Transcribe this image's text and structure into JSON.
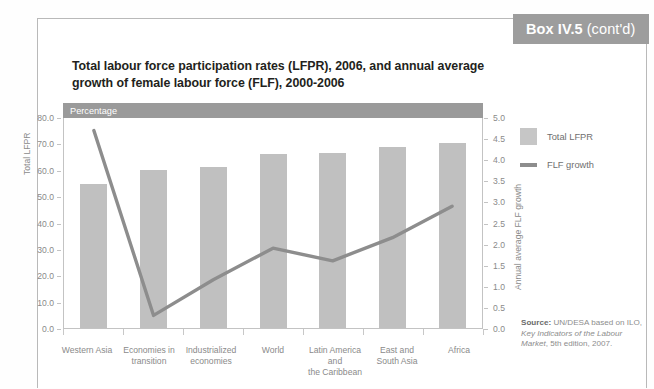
{
  "box_header": {
    "label_bold": "Box IV.5",
    "label_cont": "(cont'd)"
  },
  "chart_title": "Total labour force participation rates (LFPR), 2006, and annual average growth of female labour force (FLF), 2000-2006",
  "percentage_band": "Percentage",
  "legend": [
    {
      "label": "Total LFPR",
      "type": "bar",
      "color": "#c6c6c6"
    },
    {
      "label": "FLF growth",
      "type": "line",
      "color": "#8d8d8d"
    }
  ],
  "source": {
    "prefix": "Source:",
    "text_1": " UN/DESA based on ILO, ",
    "italic_1": "Key Indicators of the Labour Market",
    "text_2": ", 5th edition, 2007."
  },
  "chart_data": {
    "type": "bar",
    "title": "Total labour force participation rates (LFPR), 2006, and annual average growth of female labour force (FLF), 2000-2006",
    "categories": [
      "Western Asia",
      "Economies in\ntransition",
      "Industrialized\neconomies",
      "World",
      "Latin America and\nthe Caribbean",
      "East and\nSouth Asia",
      "Africa"
    ],
    "series": [
      {
        "name": "Total LFPR",
        "type": "bar",
        "axis": "left",
        "color": "#c0c0c0",
        "values": [
          54.5,
          60.0,
          61.0,
          66.0,
          66.5,
          68.5,
          70.0
        ]
      },
      {
        "name": "FLF growth",
        "type": "line",
        "axis": "right",
        "color": "#8d8d8d",
        "values": [
          4.7,
          0.3,
          1.15,
          1.9,
          1.6,
          2.15,
          2.9
        ]
      }
    ],
    "xlabel": "",
    "ylabel": "Total LFPR",
    "y2label": "Annual average FLF growth",
    "ylim": [
      0,
      80
    ],
    "y2lim": [
      0,
      5
    ],
    "yticks": [
      "0.0",
      "10.0",
      "20.0",
      "30.0",
      "40.0",
      "50.0",
      "60.0",
      "70.0",
      "80.0"
    ],
    "y2ticks": [
      "0.0",
      "0.5",
      "1.0",
      "1.5",
      "2.0",
      "2.5",
      "3.0",
      "3.5",
      "4.0",
      "4.5",
      "5.0"
    ],
    "grid": false,
    "legend_position": "right"
  }
}
